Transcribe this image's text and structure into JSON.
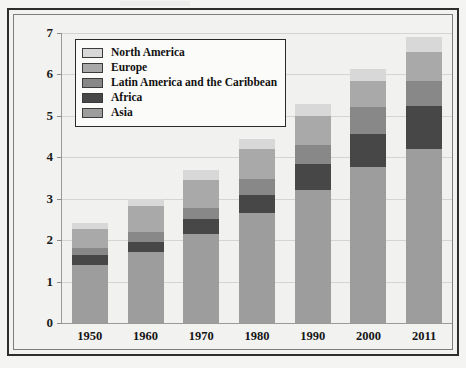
{
  "chart_data": {
    "type": "bar",
    "subtype": "stacked-vertical",
    "title": "",
    "xlabel": "",
    "ylabel": "Population in billions",
    "ylim": [
      0,
      7
    ],
    "ytick_labels": [
      "0",
      "1",
      "2",
      "3",
      "4",
      "5",
      "6",
      "7"
    ],
    "ytick_values": [
      0,
      1,
      2,
      3,
      4,
      5,
      6,
      7
    ],
    "grid": true,
    "grid_axis": "y",
    "legend_position": "top-left",
    "stack_order_bottom_to_top": [
      "Asia",
      "Africa",
      "Latin America and the Caribbean",
      "Europe",
      "North America"
    ],
    "categories": [
      "1950",
      "1960",
      "1970",
      "1980",
      "1990",
      "2000",
      "2011"
    ],
    "series": [
      {
        "name": "Asia",
        "color": "#9d9d9d",
        "values": [
          1.4,
          1.72,
          2.15,
          2.65,
          3.2,
          3.76,
          4.21
        ]
      },
      {
        "name": "Africa",
        "color": "#474747",
        "values": [
          0.23,
          0.23,
          0.35,
          0.43,
          0.63,
          0.81,
          1.04
        ]
      },
      {
        "name": "Latin America and the Caribbean",
        "color": "#888888",
        "values": [
          0.17,
          0.25,
          0.28,
          0.4,
          0.47,
          0.65,
          0.58
        ]
      },
      {
        "name": "Europe",
        "color": "#a9a9a9",
        "values": [
          0.48,
          0.62,
          0.67,
          0.72,
          0.7,
          0.63,
          0.72
        ]
      },
      {
        "name": "North America",
        "color": "#d8d8d8",
        "values": [
          0.14,
          0.18,
          0.25,
          0.25,
          0.28,
          0.28,
          0.35
        ]
      }
    ],
    "totals": [
      2.42,
      3.0,
      3.7,
      4.45,
      5.28,
      6.13,
      6.9
    ],
    "cumulative_tops": {
      "Asia": [
        1.4,
        1.72,
        2.15,
        2.65,
        3.2,
        3.76,
        4.21
      ],
      "Africa": [
        1.63,
        1.95,
        2.5,
        3.08,
        3.83,
        4.57,
        5.25
      ],
      "Latin America and the Caribbean": [
        1.8,
        2.2,
        2.78,
        3.48,
        4.3,
        5.22,
        5.83
      ],
      "Europe": [
        2.28,
        2.82,
        3.45,
        4.2,
        5.0,
        5.85,
        6.55
      ],
      "North America": [
        2.42,
        3.0,
        3.7,
        4.45,
        5.28,
        6.13,
        6.9
      ]
    }
  },
  "legend": {
    "entries": [
      {
        "label": "North America",
        "color": "#d8d8d8"
      },
      {
        "label": "Europe",
        "color": "#a9a9a9"
      },
      {
        "label": "Latin America and the Caribbean",
        "color": "#888888"
      },
      {
        "label": "Africa",
        "color": "#474747"
      },
      {
        "label": "Asia",
        "color": "#9d9d9d"
      }
    ]
  },
  "axes": {
    "y_title": "Population in billions"
  },
  "colors": {
    "plot_background": "#f1f1ef",
    "page_background": "#f2f2f0",
    "gridline": "#d4d4d2",
    "axis_line": "#9a9a9a",
    "frame_outer": "#2e2e2e",
    "frame_inner": "#7d7d7d",
    "text": "#141414"
  }
}
